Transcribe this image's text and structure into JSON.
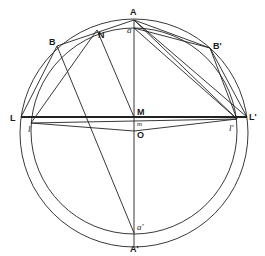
{
  "diagram": {
    "points": {
      "A": "A",
      "A_prime": "A'",
      "B": "B",
      "B_prime": "B'",
      "L": "L",
      "L_prime": "L'",
      "M": "M",
      "N": "N",
      "O": "O",
      "a": "a",
      "a_prime": "a'",
      "l": "l",
      "l_prime": "l'",
      "m": "m"
    },
    "colors": {
      "stroke": "#222222",
      "background": "#ffffff"
    }
  }
}
